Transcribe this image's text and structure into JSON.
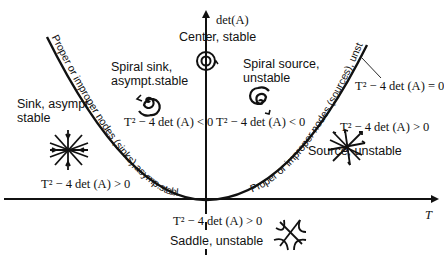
{
  "axes": {
    "y_label": "det(A)",
    "x_label": "T"
  },
  "regions": {
    "center": {
      "label": "Center, stable",
      "icon": "closed-orbit-center-icon"
    },
    "spiral_sink": {
      "label_line1": "Spiral sink,",
      "label_line2": "asympt.stable",
      "condition": "T² − 4 det (A) < 0",
      "icon": "spiral-sink-icon"
    },
    "spiral_source": {
      "label_line1": "Spiral source,",
      "label_line2": "unstable",
      "condition": "T² − 4 det (A) < 0",
      "icon": "spiral-source-icon"
    },
    "sink": {
      "label_line1": "Sink, asympt.",
      "label_line2": "stable",
      "condition": "T² − 4 det (A) > 0",
      "icon": "star-sink-icon"
    },
    "source": {
      "label": "Source, unstable",
      "condition": "T² − 4 det (A) > 0",
      "icon": "star-source-icon"
    },
    "saddle": {
      "label": "Saddle, unstable",
      "condition": "T² − 4 det (A) > 0",
      "icon": "saddle-icon"
    }
  },
  "curve": {
    "equation": "T² − 4 det (A) = 0",
    "left_branch_label": "Proper or improper nodes (sinks),asymp.stable",
    "right_branch_label": "Proper or improper nodes (sources), unstable"
  },
  "colors": {
    "ink": "#111111",
    "background": "#ffffff"
  }
}
